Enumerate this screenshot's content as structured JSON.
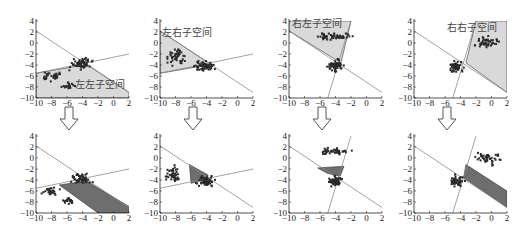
{
  "figure": {
    "rows": 2,
    "cols": 4,
    "arrow_icon": "down-arrow-outline"
  },
  "axes": {
    "xlim": [
      -10,
      2
    ],
    "ylim": [
      -10,
      4
    ],
    "xticks": [
      "-10",
      "-8",
      "-6",
      "-4",
      "-2",
      "0",
      "2"
    ],
    "yticks": [
      "4",
      "2",
      "0",
      "-2",
      "-4",
      "-6",
      "-8",
      "-10"
    ]
  },
  "colors": {
    "light_region": "#d9d9d9",
    "dark_region": "#6e6e6e",
    "line": "#8a8a8a",
    "points": "#2a2a2a",
    "axis": "#222222"
  },
  "lines": {
    "A": [
      [
        -10,
        2.2
      ],
      [
        2,
        -9
      ]
    ],
    "B": [
      [
        -10,
        -5.5
      ],
      [
        2,
        -2
      ]
    ],
    "C": [
      [
        -5,
        -10
      ],
      [
        -2,
        4
      ]
    ]
  },
  "chart_data": [
    {
      "type": "scatter",
      "panel": "top-1",
      "label": "左左子空间",
      "label_pos": [
        -5,
        -8.2
      ],
      "region": "light",
      "region_poly": [
        [
          -10,
          -5.5
        ],
        [
          -3.4,
          -3.9
        ],
        [
          2,
          -9
        ],
        [
          2,
          -10
        ],
        [
          -10,
          -10
        ]
      ],
      "lines": [
        "A",
        "B"
      ],
      "clusters": [
        [
          -4.2,
          -3.8,
          1.2,
          0.9,
          60
        ],
        [
          -8,
          -6,
          1.2,
          0.8,
          35
        ],
        [
          -5.8,
          -7.8,
          0.8,
          0.6,
          20
        ]
      ],
      "xlim": [
        -10,
        2
      ],
      "ylim": [
        -10,
        4
      ]
    },
    {
      "type": "scatter",
      "panel": "top-2",
      "label": "左右子空间",
      "label_pos": [
        -9.8,
        1.2
      ],
      "region": "light",
      "region_poly": [
        [
          -10,
          2.2
        ],
        [
          -3.4,
          -3.9
        ],
        [
          -10,
          -5.5
        ]
      ],
      "lines": [
        "A",
        "B"
      ],
      "clusters": [
        [
          -4.2,
          -4.2,
          1.1,
          0.8,
          60
        ],
        [
          -8,
          -2.5,
          1.3,
          1.4,
          45
        ]
      ],
      "xlim": [
        -10,
        2
      ],
      "ylim": [
        -10,
        4
      ]
    },
    {
      "type": "scatter",
      "panel": "top-3",
      "label": "右左子空间",
      "label_pos": [
        -9.6,
        3.0
      ],
      "region": "light",
      "region_poly": [
        [
          -10,
          4
        ],
        [
          -2,
          4
        ],
        [
          -3.3,
          -3.6
        ],
        [
          -10,
          2.2
        ]
      ],
      "lines": [
        "A",
        "C"
      ],
      "clusters": [
        [
          -4,
          -4.2,
          0.9,
          1.0,
          60
        ],
        [
          -4.5,
          1.2,
          2.3,
          0.6,
          50
        ]
      ],
      "xlim": [
        -10,
        2
      ],
      "ylim": [
        -10,
        4
      ]
    },
    {
      "type": "scatter",
      "panel": "top-4",
      "label": "右右子空间",
      "label_pos": [
        -5.8,
        2.2
      ],
      "region": "light",
      "region_poly": [
        [
          -3.3,
          -3.6
        ],
        [
          -2,
          4
        ],
        [
          1.5,
          4
        ],
        [
          2,
          4
        ],
        [
          2,
          -9
        ]
      ],
      "lines": [
        "A",
        "C"
      ],
      "clusters": [
        [
          -4.5,
          -4.3,
          0.8,
          0.9,
          55
        ],
        [
          -0.5,
          0,
          1.5,
          1.0,
          45
        ]
      ],
      "xlim": [
        -10,
        2
      ],
      "ylim": [
        -10,
        4
      ]
    },
    {
      "type": "scatter",
      "panel": "bottom-1",
      "label": "",
      "region": "dark",
      "region_poly": [
        [
          -7,
          -4.9
        ],
        [
          -3.5,
          -4.2
        ],
        [
          2,
          -8.8
        ],
        [
          2,
          -10
        ],
        [
          -2,
          -10
        ]
      ],
      "lines": [
        "A",
        "B"
      ],
      "clusters": [
        [
          -4.2,
          -3.8,
          1.1,
          0.9,
          55
        ],
        [
          -8,
          -6,
          1.1,
          0.7,
          30
        ],
        [
          -5.8,
          -7.8,
          0.7,
          0.6,
          18
        ]
      ],
      "xlim": [
        -10,
        2
      ],
      "ylim": [
        -10,
        4
      ]
    },
    {
      "type": "scatter",
      "panel": "bottom-2",
      "label": "",
      "region": "dark",
      "region_poly": [
        [
          -6.2,
          -1.2
        ],
        [
          -3.8,
          -3.1
        ],
        [
          -3.9,
          -3.8
        ],
        [
          -6,
          -4.6
        ]
      ],
      "lines": [
        "A",
        "B"
      ],
      "clusters": [
        [
          -4.2,
          -4.2,
          1.0,
          0.8,
          55
        ],
        [
          -8.3,
          -3,
          1.0,
          1.3,
          45
        ]
      ],
      "xlim": [
        -10,
        2
      ],
      "ylim": [
        -10,
        4
      ]
    },
    {
      "type": "scatter",
      "panel": "bottom-3",
      "label": "",
      "region": "dark",
      "region_poly": [
        [
          -6.3,
          -1.8
        ],
        [
          -2.9,
          -1.5
        ],
        [
          -3.4,
          -3.3
        ],
        [
          -5,
          -2.8
        ]
      ],
      "lines": [
        "A",
        "C"
      ],
      "clusters": [
        [
          -4,
          -4.2,
          0.8,
          0.9,
          55
        ],
        [
          -4.5,
          1.2,
          2.2,
          0.6,
          45
        ]
      ],
      "xlim": [
        -10,
        2
      ],
      "ylim": [
        -10,
        4
      ]
    },
    {
      "type": "scatter",
      "panel": "bottom-4",
      "label": "",
      "region": "dark",
      "region_poly": [
        [
          -3.3,
          -1.2
        ],
        [
          -3.6,
          -3.6
        ],
        [
          2,
          -9
        ],
        [
          2,
          -6
        ]
      ],
      "lines": [
        "A",
        "C"
      ],
      "clusters": [
        [
          -4.5,
          -4.2,
          0.8,
          0.9,
          50
        ],
        [
          -0.5,
          0,
          1.5,
          1.0,
          45
        ]
      ],
      "xlim": [
        -10,
        2
      ],
      "ylim": [
        -10,
        4
      ]
    }
  ]
}
